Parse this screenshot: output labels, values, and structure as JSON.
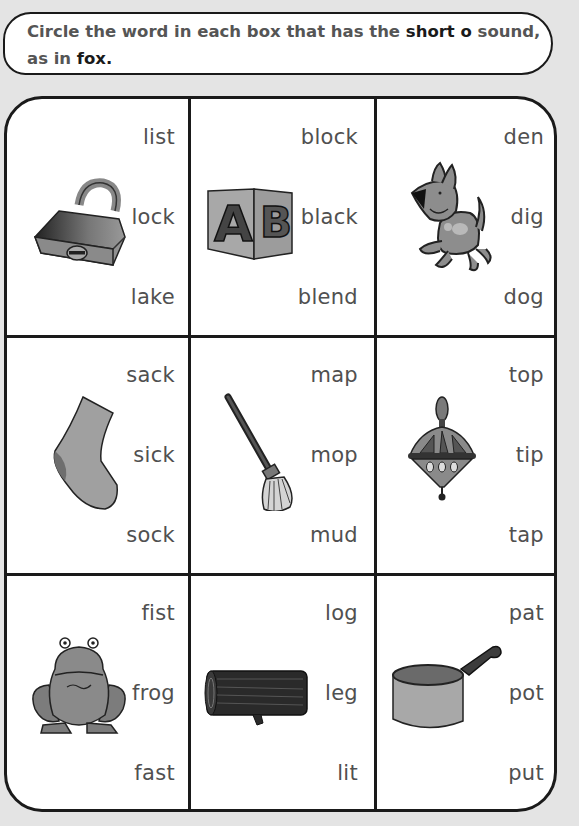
{
  "instruction": {
    "prefix": "Circle the word in each box that has the ",
    "emphasis1": "short o",
    "middle": " sound, as in ",
    "emphasis2": "fox",
    "suffix": "."
  },
  "boxes": [
    {
      "picture": "padlock",
      "words": [
        "list",
        "lock",
        "lake"
      ]
    },
    {
      "picture": "alphabet-block",
      "words": [
        "block",
        "black",
        "blend"
      ]
    },
    {
      "picture": "dog",
      "words": [
        "den",
        "dig",
        "dog"
      ]
    },
    {
      "picture": "sock",
      "words": [
        "sack",
        "sick",
        "sock"
      ]
    },
    {
      "picture": "mop",
      "words": [
        "map",
        "mop",
        "mud"
      ]
    },
    {
      "picture": "spinning-top",
      "words": [
        "top",
        "tip",
        "tap"
      ]
    },
    {
      "picture": "frog",
      "words": [
        "fist",
        "frog",
        "fast"
      ]
    },
    {
      "picture": "log",
      "words": [
        "log",
        "leg",
        "lit"
      ]
    },
    {
      "picture": "pot",
      "words": [
        "pat",
        "pot",
        "put"
      ]
    }
  ],
  "block_letters": [
    "A",
    "B"
  ]
}
